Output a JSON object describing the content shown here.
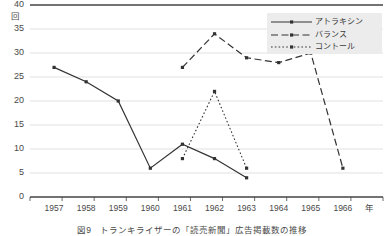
{
  "chart_data": {
    "type": "line",
    "title": "",
    "caption": "図9　トランキライザーの「読売新聞」広告掲載数の推移",
    "xlabel": "年",
    "ylabel": "回",
    "categories": [
      "1957",
      "1958",
      "1959",
      "1960",
      "1961",
      "1962",
      "1963",
      "1964",
      "1965",
      "1966"
    ],
    "ylim": [
      0,
      40
    ],
    "ytick_values": [
      "0",
      "5",
      "10",
      "15",
      "20",
      "25",
      "30",
      "35",
      "40"
    ],
    "grid": true,
    "legend_position": "top-right",
    "series": [
      {
        "name": "アトラキシン",
        "style": "solid",
        "values": [
          27,
          24,
          20,
          6,
          11,
          8,
          4,
          null,
          null,
          null
        ]
      },
      {
        "name": "バランス",
        "style": "dashed",
        "values": [
          null,
          null,
          null,
          null,
          27,
          34,
          29,
          28,
          30,
          6
        ]
      },
      {
        "name": "コントール",
        "style": "dotted",
        "values": [
          null,
          null,
          null,
          null,
          8,
          22,
          6,
          null,
          null,
          null
        ]
      }
    ]
  },
  "colors": {
    "line": "#333333",
    "grid": "#d9d9d9",
    "axis": "#444444",
    "legend_bg": "#ececec",
    "text": "#4a4a4a"
  }
}
